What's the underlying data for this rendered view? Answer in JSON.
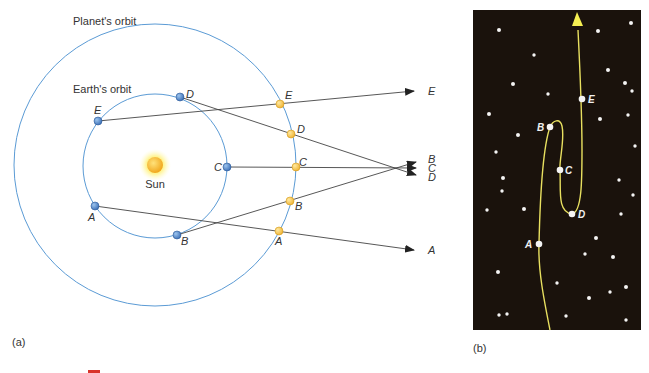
{
  "panel_a": {
    "label": "(a)",
    "planet_orbit_label": "Planet's orbit",
    "earth_orbit_label": "Earth's orbit",
    "sun_label": "Sun",
    "earth_positions": [
      {
        "name": "A",
        "x": 95,
        "y": 206
      },
      {
        "name": "B",
        "x": 177,
        "y": 235
      },
      {
        "name": "C",
        "x": 227,
        "y": 167
      },
      {
        "name": "D",
        "x": 180,
        "y": 97
      },
      {
        "name": "E",
        "x": 98,
        "y": 121
      }
    ],
    "planet_positions": [
      {
        "name": "A",
        "x": 279,
        "y": 231
      },
      {
        "name": "B",
        "x": 290,
        "y": 201
      },
      {
        "name": "C",
        "x": 296,
        "y": 167
      },
      {
        "name": "D",
        "x": 291,
        "y": 134
      },
      {
        "name": "E",
        "x": 280,
        "y": 104
      }
    ],
    "sightline_labels": {
      "E": "E",
      "B": "B",
      "C": "C",
      "D": "D",
      "A": "A"
    }
  },
  "panel_b": {
    "label": "(b)",
    "path_points": [
      {
        "name": "A",
        "x": 539,
        "y": 244
      },
      {
        "name": "B",
        "x": 550,
        "y": 127
      },
      {
        "name": "C",
        "x": 560,
        "y": 170
      },
      {
        "name": "D",
        "x": 572,
        "y": 214
      },
      {
        "name": "E",
        "x": 582,
        "y": 99
      }
    ],
    "stars": [
      [
        499,
        30
      ],
      [
        598,
        31
      ],
      [
        631,
        23
      ],
      [
        534,
        55
      ],
      [
        608,
        70
      ],
      [
        513,
        84
      ],
      [
        625,
        83
      ],
      [
        632,
        91
      ],
      [
        489,
        114
      ],
      [
        600,
        119
      ],
      [
        628,
        115
      ],
      [
        518,
        135
      ],
      [
        496,
        152
      ],
      [
        635,
        146
      ],
      [
        503,
        178
      ],
      [
        502,
        191
      ],
      [
        619,
        180
      ],
      [
        633,
        195
      ],
      [
        487,
        210
      ],
      [
        524,
        209
      ],
      [
        621,
        214
      ],
      [
        596,
        238
      ],
      [
        585,
        254
      ],
      [
        613,
        257
      ],
      [
        498,
        272
      ],
      [
        557,
        283
      ],
      [
        626,
        287
      ],
      [
        589,
        298
      ],
      [
        610,
        292
      ],
      [
        499,
        315
      ],
      [
        507,
        314
      ],
      [
        566,
        316
      ],
      [
        626,
        320
      ],
      [
        548,
        94
      ]
    ]
  },
  "colors": {
    "orbit": "#5b9bd5",
    "earth": "#4a7fc4",
    "planet": "#f5c242",
    "sightline": "#444444",
    "sky": "#1a120c",
    "path": "#e8e060"
  }
}
